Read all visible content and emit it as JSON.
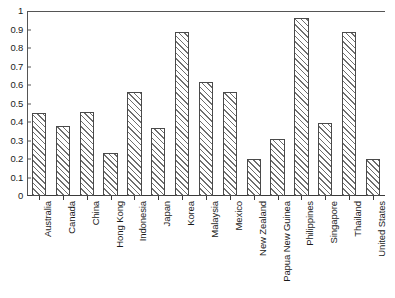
{
  "chart_data": {
    "type": "bar",
    "title": "",
    "xlabel": "",
    "ylabel": "",
    "ylim": [
      0,
      1
    ],
    "grid": false,
    "legend": "none",
    "y_ticks": [
      "1",
      "0.9",
      "0.8",
      "0.7",
      "0.6",
      "0.5",
      "0.4",
      "0.3",
      "0.2",
      "0.1",
      "0"
    ],
    "y_tick_values": [
      1,
      0.9,
      0.8,
      0.7,
      0.6,
      0.5,
      0.4,
      0.3,
      0.2,
      0.1,
      0
    ],
    "categories": [
      "Australia",
      "Canada",
      "China",
      "Hong Kong",
      "Indonesia",
      "Japan",
      "Korea",
      "Malaysia",
      "Mexico",
      "New Zealand",
      "Papua New Guinea",
      "Philippines",
      "Singapore",
      "Thailand",
      "United States"
    ],
    "values": [
      0.45,
      0.38,
      0.455,
      0.235,
      0.56,
      0.365,
      0.885,
      0.615,
      0.56,
      0.2,
      0.31,
      0.96,
      0.395,
      0.885,
      0.2
    ],
    "bar_style": {
      "fill": "#ffffff",
      "hatch": "forward-diagonal",
      "hatch_color": "#6e6e6e",
      "edge_color": "#4a4a4a"
    },
    "axis_color": "#555555"
  }
}
